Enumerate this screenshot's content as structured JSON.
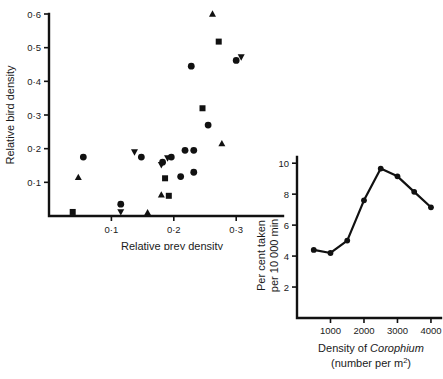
{
  "figure": {
    "name": "two-panel-ecology-figure",
    "background": "#ffffff",
    "ink_color": "#111111"
  },
  "chart_data": [
    {
      "id": "scatter-bird-prey",
      "type": "scatter",
      "title": "",
      "xlabel": "Relative prey density",
      "ylabel": "Relative bird density",
      "xlim": [
        0.0,
        0.375
      ],
      "ylim": [
        0.0,
        0.6
      ],
      "xticks": [
        0.1,
        0.2,
        0.3
      ],
      "xticklabels": [
        "0·1",
        "0·2",
        "0·3"
      ],
      "yticks": [
        0.1,
        0.2,
        0.3,
        0.4,
        0.5,
        0.6
      ],
      "yticklabels": [
        "0·1",
        "0·2",
        "0·3",
        "0·4",
        "0·5",
        "0·6"
      ],
      "grid": false,
      "legend": "none",
      "series": [
        {
          "name": "circle",
          "marker": "circle",
          "points": [
            [
              0.055,
              0.175
            ],
            [
              0.115,
              0.035
            ],
            [
              0.148,
              0.175
            ],
            [
              0.182,
              0.16
            ],
            [
              0.196,
              0.175
            ],
            [
              0.218,
              0.195
            ],
            [
              0.228,
              0.445
            ],
            [
              0.232,
              0.13
            ],
            [
              0.255,
              0.27
            ],
            [
              0.3,
              0.462
            ],
            [
              0.211,
              0.117
            ],
            [
              0.232,
              0.195
            ]
          ]
        },
        {
          "name": "square",
          "marker": "square",
          "points": [
            [
              0.038,
              0.012
            ],
            [
              0.186,
              0.112
            ],
            [
              0.192,
              0.06
            ],
            [
              0.246,
              0.32
            ],
            [
              0.272,
              0.518
            ]
          ]
        },
        {
          "name": "triangle-up",
          "marker": "triangle-up",
          "points": [
            [
              0.047,
              0.115
            ],
            [
              0.158,
              0.01
            ],
            [
              0.18,
              0.063
            ],
            [
              0.262,
              0.6
            ],
            [
              0.277,
              0.215
            ]
          ]
        },
        {
          "name": "triangle-down",
          "marker": "triangle-down",
          "points": [
            [
              0.115,
              0.012
            ],
            [
              0.137,
              0.19
            ],
            [
              0.18,
              0.152
            ],
            [
              0.19,
              0.172
            ],
            [
              0.308,
              0.472
            ]
          ]
        }
      ]
    },
    {
      "id": "line-corophium-predation",
      "type": "line",
      "title": "",
      "xlabel_line1": "Density of ",
      "xlabel_italic": "Corophium",
      "xlabel_line2": "(number per m",
      "xlabel_super": "2",
      "xlabel_line2_end": ")",
      "ylabel_line1": "Per cent taken",
      "ylabel_line2": "per 10 000 min",
      "xlim": [
        0,
        4300
      ],
      "ylim": [
        0,
        10.4
      ],
      "xticks": [
        1000,
        2000,
        3000,
        4000
      ],
      "xticklabels": [
        "1000",
        "2000",
        "3000",
        "4000"
      ],
      "yticks": [
        2,
        4,
        6,
        8,
        10
      ],
      "yticklabels": [
        "2",
        "4",
        "6",
        "8",
        "10"
      ],
      "grid": false,
      "legend": "none",
      "x": [
        500,
        1000,
        1500,
        2000,
        2500,
        3000,
        3500,
        4000
      ],
      "values": [
        4.4,
        4.2,
        5.0,
        7.6,
        9.65,
        9.15,
        8.15,
        7.15
      ],
      "marker": "circle"
    }
  ]
}
